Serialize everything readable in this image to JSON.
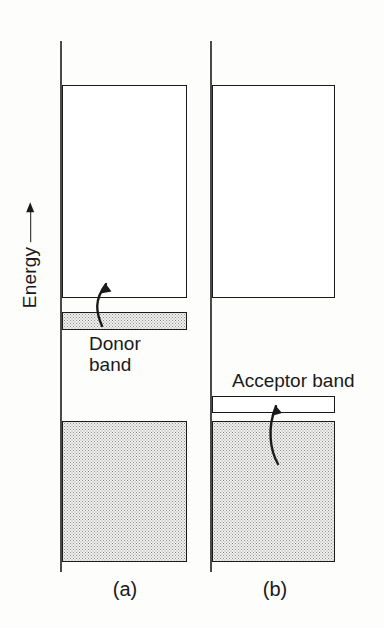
{
  "figure": {
    "axis": {
      "label": "Energy",
      "arrow_icon": "up-arrow-icon",
      "direction": "up"
    },
    "panels": [
      {
        "id": "a",
        "caption": "(a)",
        "type": "donor",
        "bands": [
          {
            "name": "conduction band",
            "fill": "empty"
          },
          {
            "name": "donor band",
            "fill": "filled",
            "label": "Donor\nband"
          },
          {
            "name": "valence band",
            "fill": "filled"
          }
        ],
        "transition": {
          "icon": "curved-arrow-up-icon",
          "from": "donor band",
          "to": "conduction band"
        }
      },
      {
        "id": "b",
        "caption": "(b)",
        "type": "acceptor",
        "bands": [
          {
            "name": "conduction band",
            "fill": "empty"
          },
          {
            "name": "acceptor band",
            "fill": "empty",
            "label": "Acceptor band"
          },
          {
            "name": "valence band",
            "fill": "filled"
          }
        ],
        "transition": {
          "icon": "curved-arrow-up-icon",
          "from": "valence band",
          "to": "acceptor band"
        }
      }
    ],
    "colors": {
      "line": "#1a1a1a",
      "baseline": "#4a4a4a",
      "fill_stipple": "#f2f2f0",
      "background": "#fdfdfc"
    }
  }
}
